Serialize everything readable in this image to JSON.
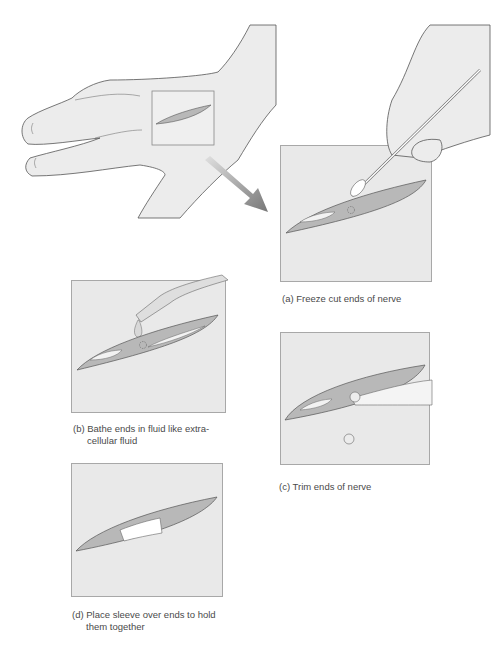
{
  "figure": {
    "steps": [
      {
        "id": "a",
        "label": "(a) Freeze cut ends of nerve"
      },
      {
        "id": "b",
        "label_line1": "(b) Bathe ends in fluid like extra-",
        "label_line2": "cellular fluid"
      },
      {
        "id": "c",
        "label": "(c) Trim ends of nerve"
      },
      {
        "id": "d",
        "label_line1": "(d) Place sleeve over ends to hold",
        "label_line2": "them together"
      }
    ],
    "colors": {
      "panel_bg": "#e9e9e9",
      "panel_border": "#a8a8a8",
      "nerve_fill": "#b8b8b8",
      "nerve_inner": "#f2f2f2",
      "skin": "#ececec",
      "outline": "#555555",
      "arrow": "#8a8a8a",
      "caption": "#4a4a4a"
    }
  }
}
